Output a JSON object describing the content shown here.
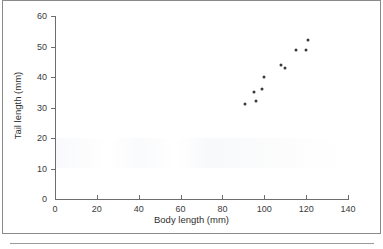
{
  "chart_data": {
    "type": "scatter",
    "title": "",
    "xlabel": "Body length (mm)",
    "ylabel": "Tail length (mm)",
    "xlim": [
      0,
      140
    ],
    "ylim": [
      0,
      60
    ],
    "xticks": [
      0,
      20,
      40,
      60,
      80,
      100,
      120,
      140
    ],
    "yticks": [
      0,
      10,
      20,
      30,
      40,
      50,
      60
    ],
    "grid": false,
    "legend": null,
    "marker_color": "#3a3a3a",
    "axis_color": "#6d6d6d",
    "points": [
      {
        "x": 91,
        "y": 31
      },
      {
        "x": 95,
        "y": 35
      },
      {
        "x": 96,
        "y": 32
      },
      {
        "x": 99,
        "y": 36
      },
      {
        "x": 100,
        "y": 40
      },
      {
        "x": 108,
        "y": 44
      },
      {
        "x": 110,
        "y": 43
      },
      {
        "x": 115,
        "y": 49
      },
      {
        "x": 120,
        "y": 49
      },
      {
        "x": 121,
        "y": 52
      }
    ]
  }
}
